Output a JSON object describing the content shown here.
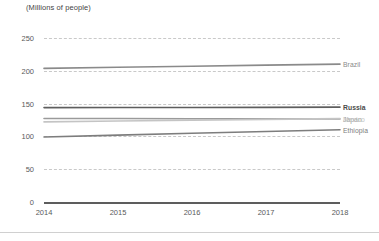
{
  "chart_data": {
    "type": "line",
    "title": "(Millions of people)",
    "xlabel": "",
    "ylabel": "(Millions of people)",
    "x": [
      2014,
      2015,
      2016,
      2017,
      2018
    ],
    "xticklabels": [
      "2014",
      "2015",
      "2016",
      "2017",
      "2018"
    ],
    "yticklabels": [
      "250",
      "200",
      "150",
      "100",
      "50",
      "0"
    ],
    "yticks": [
      250,
      200,
      150,
      100,
      50,
      0
    ],
    "ylim": [
      0,
      262
    ],
    "xlim": [
      2014,
      2018
    ],
    "grid": "horizontal-dashed",
    "legend_position": "right-inline-end-of-line",
    "series": [
      {
        "name": "Brazil",
        "values": [
          203.5,
          205.2,
          206.8,
          208.5,
          210.0
        ],
        "color": "#8a8a8a"
      },
      {
        "name": "Russia",
        "values": [
          143.8,
          143.9,
          144.0,
          144.2,
          144.5
        ],
        "color": "#5e5e5e"
      },
      {
        "name": "Japan",
        "values": [
          127.3,
          127.1,
          126.9,
          126.7,
          126.5
        ],
        "color": "#9a9a9a"
      },
      {
        "name": "Mexico",
        "values": [
          122.0,
          123.3,
          124.6,
          125.8,
          127.0
        ],
        "color": "#c4c4c4"
      },
      {
        "name": "Ethiopia",
        "values": [
          99.0,
          101.9,
          104.7,
          107.5,
          110.1
        ],
        "color": "#7d7d7d"
      }
    ]
  },
  "legend": {
    "items": [
      {
        "label": "Brazil",
        "color": "#8a8a8a"
      },
      {
        "label": "Russia",
        "color": "#5e5e5e"
      },
      {
        "label": "Japan",
        "color": "#9a9a9a"
      },
      {
        "label": "Mexico",
        "color": "#c4c4c4"
      },
      {
        "label": "Ethiopia",
        "color": "#7d7d7d"
      }
    ]
  },
  "colors": {
    "background": "#ffffff",
    "gridline": "#c9c9c9",
    "axis": "#5d5d5d",
    "tick_text": "#5a5a5a",
    "title_text": "#444444",
    "bottom_rule": "#d0d0d0"
  }
}
